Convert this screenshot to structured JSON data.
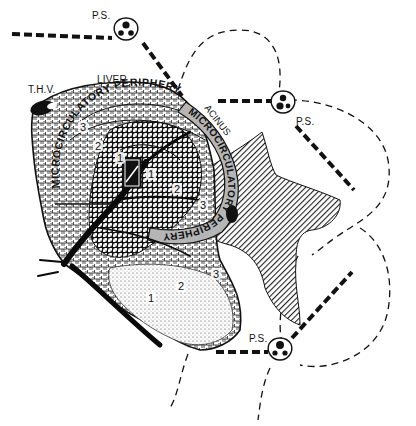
{
  "diagram": {
    "colors": {
      "ink": "#111111",
      "background": "#ffffff",
      "band_gray": "#b8b8b8",
      "hatch": "#333333"
    },
    "labels": {
      "ps_top": "P.S.",
      "ps_right": "P.S.",
      "ps_bottom": "P.S.",
      "thv": "T.H.V.",
      "liver": "LIVER",
      "acinus": "ACINUS",
      "periphery_upper": "MICROCIRCULATORY PERIPHERY",
      "periphery_right": "MICROCIRCULATORY PERIPHERY"
    },
    "zones": [
      {
        "id": "z3a",
        "label": "3"
      },
      {
        "id": "z2a",
        "label": "2"
      },
      {
        "id": "z1a",
        "label": "1"
      },
      {
        "id": "z1b",
        "label": "1"
      },
      {
        "id": "z2b",
        "label": "2"
      },
      {
        "id": "z3b",
        "label": "3"
      },
      {
        "id": "z3c",
        "label": "3"
      },
      {
        "id": "z2c",
        "label": "2"
      },
      {
        "id": "z1c",
        "label": "1"
      }
    ],
    "icons": {
      "portal_space": "portal-triad-icon",
      "terminal_hepatic_vein": "vein-blob-icon"
    }
  }
}
